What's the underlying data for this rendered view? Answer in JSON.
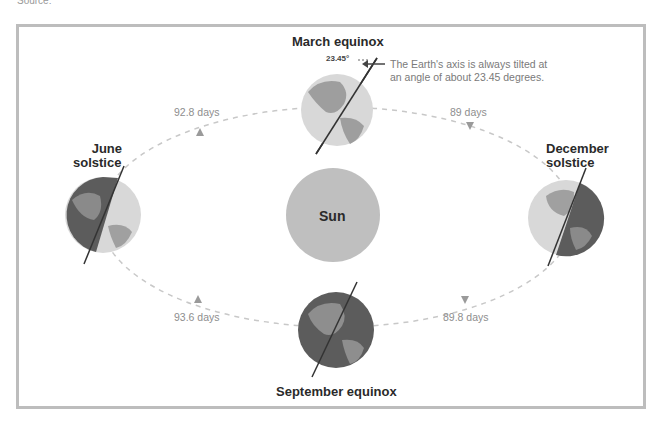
{
  "source": "Source:",
  "diagram": {
    "sun_label": "Sun",
    "positions": {
      "march": "March equinox",
      "june_line1": "June",
      "june_line2": "solstice",
      "december_line1": "December",
      "december_line2": "solstice",
      "september": "September equinox"
    },
    "intervals": {
      "june_to_march": "92.8 days",
      "march_to_december": "89 days",
      "september_to_june": "93.6 days",
      "december_to_september": "89.8 days"
    },
    "tilt_angle": "23.45°",
    "note_line1": "The Earth's axis is always tilted at",
    "note_line2": "an angle of about 23.45 degrees.",
    "colors": {
      "sun": "#bfbfbf",
      "orbit": "#c8c8c8",
      "land_light": "#9a9a9a",
      "ocean_light": "#d6d6d6",
      "night": "#5a5a5a",
      "frame": "#bdbdbd"
    }
  }
}
